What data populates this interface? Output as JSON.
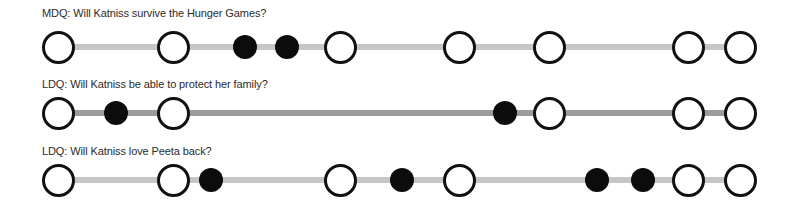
{
  "rows": [
    {
      "label": "MDQ: Will Katniss survive the Hunger Games?",
      "label_top": 7,
      "line_y": 47,
      "line_color": "#c6c6c6",
      "line_start": 58,
      "line_end": 740,
      "nodes": [
        {
          "x": 58,
          "type": "open"
        },
        {
          "x": 173,
          "type": "open"
        },
        {
          "x": 245,
          "type": "filled"
        },
        {
          "x": 287,
          "type": "filled"
        },
        {
          "x": 340,
          "type": "open"
        },
        {
          "x": 459,
          "type": "open"
        },
        {
          "x": 549,
          "type": "open"
        },
        {
          "x": 688,
          "type": "open"
        },
        {
          "x": 740,
          "type": "open"
        }
      ]
    },
    {
      "label": "LDQ: Will Katniss be able to protect her family?",
      "label_top": 78,
      "line_y": 113,
      "line_color": "#9c9c9c",
      "line_start": 58,
      "line_end": 740,
      "nodes": [
        {
          "x": 58,
          "type": "open"
        },
        {
          "x": 116,
          "type": "filled"
        },
        {
          "x": 173,
          "type": "open"
        },
        {
          "x": 505,
          "type": "filled"
        },
        {
          "x": 549,
          "type": "open"
        },
        {
          "x": 688,
          "type": "open"
        },
        {
          "x": 740,
          "type": "open"
        }
      ]
    },
    {
      "label": "LDQ: Will Katniss love Peeta back?",
      "label_top": 145,
      "line_y": 180,
      "line_color": "#c6c6c6",
      "line_start": 58,
      "line_end": 740,
      "nodes": [
        {
          "x": 58,
          "type": "open"
        },
        {
          "x": 173,
          "type": "open"
        },
        {
          "x": 211,
          "type": "filled"
        },
        {
          "x": 340,
          "type": "open"
        },
        {
          "x": 402,
          "type": "filled"
        },
        {
          "x": 459,
          "type": "open"
        },
        {
          "x": 597,
          "type": "filled"
        },
        {
          "x": 643,
          "type": "filled"
        },
        {
          "x": 688,
          "type": "open"
        },
        {
          "x": 740,
          "type": "open"
        }
      ]
    }
  ],
  "legend": {
    "open_node": "open circle",
    "filled_node": "filled circle"
  }
}
